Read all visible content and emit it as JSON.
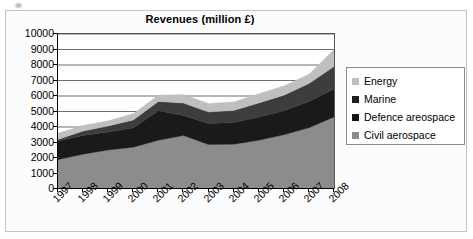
{
  "figure": {
    "title": "Revenues (million £)"
  },
  "chart_data": {
    "type": "area",
    "title": "Revenues (million £)",
    "xlabel": "",
    "ylabel": "",
    "stacked": true,
    "grid": true,
    "legend_position": "right",
    "ylim": [
      0,
      10000
    ],
    "yticks": [
      "0",
      "1000",
      "2000",
      "3000",
      "4000",
      "5000",
      "6000",
      "7000",
      "8000",
      "9000",
      "10000"
    ],
    "ytick_values": [
      0,
      1000,
      2000,
      3000,
      4000,
      5000,
      6000,
      7000,
      8000,
      9000,
      10000
    ],
    "categories": [
      "1997",
      "1998",
      "1999",
      "2000",
      "2001",
      "2002",
      "2003",
      "2004",
      "2005",
      "2006",
      "2007",
      "2008"
    ],
    "series": [
      {
        "name": "Civil aerospace",
        "color": "#8c8c8c",
        "values": [
          1900,
          2250,
          2520,
          2700,
          3150,
          3450,
          2870,
          2890,
          3150,
          3500,
          3950,
          4650
        ]
      },
      {
        "name": "Defence areospace",
        "color": "#1a1a1a",
        "values": [
          1200,
          1200,
          1150,
          1250,
          1900,
          1300,
          1350,
          1400,
          1500,
          1550,
          1700,
          1800
        ]
      },
      {
        "name": "Marine",
        "color": "#3d3d3d",
        "values": [
          100,
          300,
          400,
          500,
          600,
          800,
          750,
          780,
          900,
          1000,
          1150,
          1450
        ]
      },
      {
        "name": "Energy",
        "color": "#bfbfbf",
        "values": [
          400,
          350,
          330,
          400,
          400,
          550,
          550,
          550,
          600,
          600,
          600,
          1100
        ]
      }
    ],
    "totals": [
      3600,
      4100,
      4400,
      4850,
      6050,
      6100,
      5520,
      5620,
      6150,
      6650,
      7400,
      9000
    ]
  },
  "legend": {
    "items": [
      {
        "label": "Energy",
        "color": "#bfbfbf"
      },
      {
        "label": "Marine",
        "color": "#1f1f1f"
      },
      {
        "label": "Defence areospace",
        "color": "#141414"
      },
      {
        "label": "Civil aerospace",
        "color": "#8c8c8c"
      }
    ]
  }
}
